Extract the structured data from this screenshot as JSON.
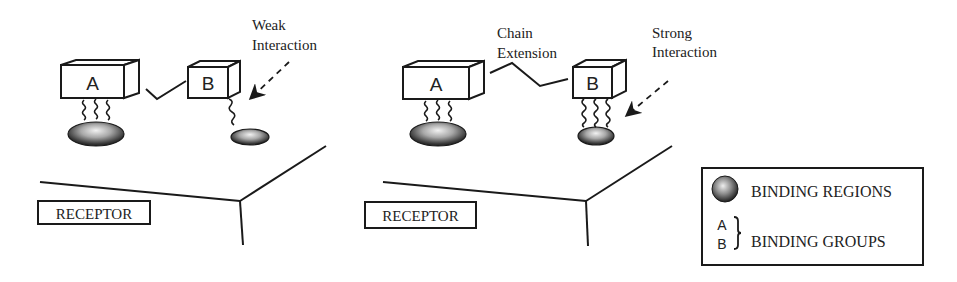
{
  "colors": {
    "line": "#1a1a1a",
    "background": "#ffffff",
    "region_dark": "#2b2b2b",
    "region_light": "#e6e6e6"
  },
  "left_panel": {
    "name": "weak-interaction-scenario",
    "group_a_label": "A",
    "group_b_label": "B",
    "annotation_line1": "Weak",
    "annotation_line2": "Interaction",
    "receptor_label": "RECEPTOR"
  },
  "right_panel": {
    "name": "strong-interaction-scenario",
    "group_a_label": "A",
    "group_b_label": "B",
    "chain_label_line1": "Chain",
    "chain_label_line2": "Extension",
    "annotation_line1": "Strong",
    "annotation_line2": "Interaction",
    "receptor_label": "RECEPTOR"
  },
  "legend": {
    "regions_label": "BINDING REGIONS",
    "groups_label": "BINDING GROUPS",
    "groups_symbol_a": "A",
    "groups_symbol_b": "B"
  }
}
